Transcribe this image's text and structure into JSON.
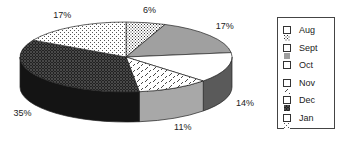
{
  "chart_data": {
    "type": "pie",
    "title": "",
    "style": "3d",
    "start_at": "top",
    "direction": "clockwise",
    "categories": [
      "Aug",
      "Sept",
      "Oct",
      "Nov",
      "Dec",
      "Jan"
    ],
    "values": [
      6,
      17,
      14,
      11,
      35,
      17
    ],
    "labels": [
      "6%",
      "17%",
      "14%",
      "11%",
      "35%",
      "17%"
    ],
    "legend": {
      "placement": "right",
      "entries": [
        "Aug",
        "Sept",
        "Oct",
        "Nov",
        "Dec",
        "Jan"
      ]
    },
    "fills": {
      "Aug": {
        "pattern": "dense-dots",
        "color": "#ffffff",
        "ink": "#333333"
      },
      "Sept": {
        "pattern": "solid",
        "color": "#a0a0a0"
      },
      "Oct": {
        "pattern": "solid",
        "color": "#ffffff"
      },
      "Nov": {
        "pattern": "diagonal-dashes",
        "color": "#ffffff",
        "ink": "#333333"
      },
      "Dec": {
        "pattern": "dark-checker",
        "color": "#1a1a1a"
      },
      "Jan": {
        "pattern": "sparse-dots",
        "color": "#ffffff",
        "ink": "#444444"
      }
    },
    "side_colors": {
      "Sept": "#707070",
      "Oct": "#5a5a5a",
      "Nov": "#a8a8a8",
      "Dec": "#141414"
    }
  }
}
